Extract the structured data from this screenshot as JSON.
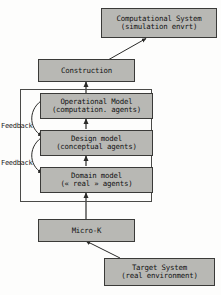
{
  "diagram": {
    "title_absent": true,
    "colors": {
      "node_fill": "#b8b8b4",
      "node_border": "#3a3a38",
      "group_border": "#4a4a48",
      "arrow": "#2a2a28",
      "background": "#fdfdfc",
      "text": "#141414"
    },
    "nodes": [
      {
        "id": "computational-system",
        "line1": "Computational System",
        "line2": "(simulation envrt)"
      },
      {
        "id": "construction",
        "line1": "Construction",
        "line2": ""
      },
      {
        "id": "operational-model",
        "line1": "Operational Model",
        "line2": "(computation. agents)"
      },
      {
        "id": "design-model",
        "line1": "Design model",
        "line2": "(conceptual agents)"
      },
      {
        "id": "domain-model",
        "line1": "Domain model",
        "line2": "(« real » agents)"
      },
      {
        "id": "micro-k",
        "line1": "Micro-K",
        "line2": ""
      },
      {
        "id": "target-system",
        "line1": "Target System",
        "line2": "(real environment)"
      }
    ],
    "feedback_labels": [
      {
        "id": "feedback-upper",
        "text": "Feedback"
      },
      {
        "id": "feedback-lower",
        "text": "Feedback"
      }
    ],
    "edges": [
      {
        "from": "construction",
        "to": "computational-system",
        "style": "solid-arrow"
      },
      {
        "from": "operational-model",
        "to": "construction",
        "style": "solid-arrow"
      },
      {
        "from": "design-model",
        "to": "operational-model",
        "style": "solid-arrow"
      },
      {
        "from": "domain-model",
        "to": "design-model",
        "style": "solid-arrow"
      },
      {
        "from": "micro-k",
        "to": "domain-model",
        "style": "solid-arrow"
      },
      {
        "from": "target-system",
        "to": "micro-k",
        "style": "solid-arrow"
      },
      {
        "from": "operational-model",
        "to": "design-model",
        "style": "curved-feedback"
      },
      {
        "from": "design-model",
        "to": "domain-model",
        "style": "curved-feedback"
      }
    ]
  }
}
